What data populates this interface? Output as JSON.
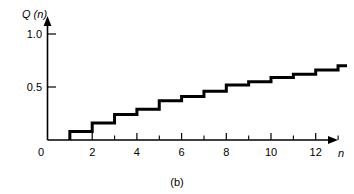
{
  "figure": {
    "caption": "(b)",
    "background_color": "#ffffff",
    "line_color": "#000000",
    "axis_color": "#000000"
  },
  "axes": {
    "y_axis_title": "Q (n)",
    "x_axis_title": "n",
    "y_ticks": [
      "1.0",
      "0.5"
    ],
    "origin_label": "0",
    "x_ticks_major": [
      "2",
      "4",
      "6",
      "8",
      "10",
      "12"
    ],
    "x_ticks_minor": [
      "1",
      "3",
      "5",
      "7",
      "9",
      "11",
      "13"
    ]
  },
  "chart_data": {
    "type": "line",
    "subtype": "step",
    "title": "",
    "subtitle": "",
    "caption": "(b)",
    "xlabel": "n",
    "ylabel": "Q (n)",
    "xlim": [
      0,
      13.4
    ],
    "ylim": [
      0,
      1.15
    ],
    "grid": false,
    "legend": null,
    "x_tick_values": [
      0,
      2,
      4,
      6,
      8,
      10,
      12
    ],
    "x_tick_labels": [
      "0",
      "2",
      "4",
      "6",
      "8",
      "10",
      "12"
    ],
    "x_minor_tick_values": [
      1,
      3,
      5,
      7,
      9,
      11,
      13
    ],
    "y_tick_values": [
      0.5,
      1.0
    ],
    "y_tick_labels": [
      "0.5",
      "1.0"
    ],
    "x": [
      1,
      2,
      3,
      4,
      5,
      6,
      7,
      8,
      9,
      10,
      11,
      12,
      13
    ],
    "values": [
      0.08,
      0.16,
      0.24,
      0.29,
      0.37,
      0.41,
      0.46,
      0.52,
      0.55,
      0.59,
      0.62,
      0.66,
      0.7
    ],
    "step_start_x": 1,
    "step_end_x": 13.4,
    "series": [
      {
        "name": "Q(n)",
        "x": [
          1,
          2,
          3,
          4,
          5,
          6,
          7,
          8,
          9,
          10,
          11,
          12,
          13
        ],
        "values": [
          0.08,
          0.16,
          0.24,
          0.29,
          0.37,
          0.41,
          0.46,
          0.52,
          0.55,
          0.59,
          0.62,
          0.66,
          0.7
        ]
      }
    ]
  }
}
